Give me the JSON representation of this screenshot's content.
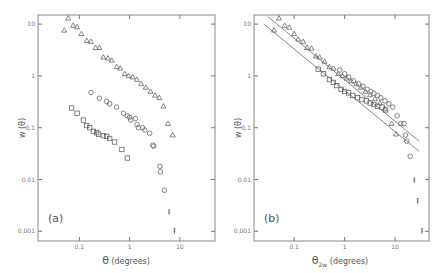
{
  "chart_data": [
    {
      "type": "scatter",
      "panel_label": "(a)",
      "title": "",
      "xlabel": "θ (degrees)",
      "ylabel": "w (θ)",
      "xscale": "log",
      "yscale": "log",
      "xlim": [
        0.015,
        50
      ],
      "ylim": [
        0.00065,
        15
      ],
      "x_ticks": [
        0.1,
        1,
        10
      ],
      "x_tick_labels": [
        "0.1",
        "1",
        "10"
      ],
      "y_ticks": [
        10,
        1,
        0.1,
        0.01,
        0.001
      ],
      "y_tick_labels": [
        "10",
        "1",
        "0.1",
        "0.01",
        "0.001"
      ],
      "grid": false,
      "legend": null,
      "series": [
        {
          "name": "triangles",
          "marker": "triangle",
          "points": [
            [
              0.05,
              7.6
            ],
            [
              0.06,
              13
            ],
            [
              0.075,
              9.4
            ],
            [
              0.09,
              8.8
            ],
            [
              0.11,
              6.5
            ],
            [
              0.14,
              4.8
            ],
            [
              0.17,
              4.6
            ],
            [
              0.21,
              3.5
            ],
            [
              0.25,
              3.5
            ],
            [
              0.3,
              2.3
            ],
            [
              0.37,
              2.2
            ],
            [
              0.44,
              2.0
            ],
            [
              0.55,
              1.5
            ],
            [
              0.65,
              1.4
            ],
            [
              0.8,
              1.1
            ],
            [
              0.95,
              1.0
            ],
            [
              1.15,
              0.95
            ],
            [
              1.4,
              0.85
            ],
            [
              1.7,
              0.7
            ],
            [
              2.1,
              0.6
            ],
            [
              2.6,
              0.5
            ],
            [
              3.2,
              0.42
            ],
            [
              3.9,
              0.38
            ],
            [
              4.7,
              0.26
            ],
            [
              5.8,
              0.12
            ],
            [
              7.2,
              0.072
            ]
          ]
        },
        {
          "name": "circles",
          "marker": "circle",
          "points": [
            [
              0.17,
              0.48
            ],
            [
              0.25,
              0.37
            ],
            [
              0.35,
              0.32
            ],
            [
              0.4,
              0.29
            ],
            [
              0.55,
              0.25
            ],
            [
              0.75,
              0.19
            ],
            [
              0.9,
              0.17
            ],
            [
              1.0,
              0.16
            ],
            [
              1.05,
              0.14
            ],
            [
              1.3,
              0.15
            ],
            [
              1.4,
              0.115
            ],
            [
              1.5,
              0.1
            ],
            [
              1.8,
              0.1
            ],
            [
              2.0,
              0.09
            ],
            [
              2.5,
              0.078
            ],
            [
              2.9,
              0.046
            ],
            [
              3.0,
              0.044
            ],
            [
              4.0,
              0.018
            ],
            [
              4.1,
              0.014
            ],
            [
              4.9,
              0.0062
            ]
          ]
        },
        {
          "name": "squares",
          "marker": "square",
          "points": [
            [
              0.07,
              0.24
            ],
            [
              0.09,
              0.19
            ],
            [
              0.12,
              0.14
            ],
            [
              0.14,
              0.11
            ],
            [
              0.16,
              0.1
            ],
            [
              0.19,
              0.085
            ],
            [
              0.22,
              0.08
            ],
            [
              0.24,
              0.075
            ],
            [
              0.3,
              0.07
            ],
            [
              0.35,
              0.068
            ],
            [
              0.4,
              0.062
            ],
            [
              0.5,
              0.053
            ],
            [
              0.7,
              0.038
            ],
            [
              0.9,
              0.026
            ]
          ]
        },
        {
          "name": "error-bar points",
          "marker": "bar",
          "points": [
            [
              6.1,
              0.0023
            ],
            [
              7.8,
              0.001
            ]
          ]
        }
      ]
    },
    {
      "type": "scatter",
      "panel_label": "(b)",
      "title": "",
      "xlabel": "θ2w (degrees)",
      "xlabel_main": "θ",
      "xlabel_sub": "2w",
      "xlabel_rest": "(degrees)",
      "ylabel": "w (θ)",
      "xscale": "log",
      "yscale": "log",
      "xlim": [
        0.016,
        47
      ],
      "ylim": [
        0.00065,
        15
      ],
      "x_ticks": [
        0.1,
        1,
        10
      ],
      "x_tick_labels": [
        "0.1",
        "1",
        "10"
      ],
      "y_ticks": [
        10,
        1,
        0.1,
        0.01,
        0.001
      ],
      "y_tick_labels": [
        "10",
        "1",
        "0.1",
        "0.01",
        "0.001"
      ],
      "grid": false,
      "legend": null,
      "fit_lines": [
        {
          "x": [
            0.03,
            30
          ],
          "y": [
            14,
            0.055
          ]
        },
        {
          "x": [
            0.025,
            30
          ],
          "y": [
            10,
            0.035
          ]
        }
      ],
      "series": [
        {
          "name": "triangles",
          "marker": "triangle",
          "points": [
            [
              0.04,
              7.6
            ],
            [
              0.05,
              13
            ],
            [
              0.065,
              9.4
            ],
            [
              0.08,
              8.6
            ],
            [
              0.1,
              6.5
            ],
            [
              0.12,
              5.1
            ],
            [
              0.15,
              4.6
            ],
            [
              0.18,
              3.5
            ],
            [
              0.22,
              3.4
            ],
            [
              0.27,
              2.4
            ],
            [
              0.32,
              2.3
            ],
            [
              0.4,
              1.9
            ],
            [
              0.5,
              1.5
            ],
            [
              0.6,
              1.4
            ],
            [
              0.75,
              1.1
            ],
            [
              0.9,
              1.0
            ],
            [
              1.1,
              0.9
            ],
            [
              1.35,
              0.8
            ],
            [
              1.7,
              0.7
            ],
            [
              2.1,
              0.6
            ],
            [
              2.6,
              0.5
            ],
            [
              3.2,
              0.43
            ],
            [
              4.0,
              0.36
            ],
            [
              5.0,
              0.3
            ],
            [
              6.3,
              0.23
            ],
            [
              8.5,
              0.12
            ],
            [
              10.5,
              0.075
            ]
          ]
        },
        {
          "name": "circles",
          "marker": "circle",
          "points": [
            [
              0.8,
              1.3
            ],
            [
              1.0,
              1.1
            ],
            [
              1.2,
              0.95
            ],
            [
              1.5,
              0.8
            ],
            [
              1.9,
              0.7
            ],
            [
              2.3,
              0.63
            ],
            [
              2.8,
              0.55
            ],
            [
              3.3,
              0.5
            ],
            [
              3.8,
              0.46
            ],
            [
              4.5,
              0.42
            ],
            [
              5.2,
              0.38
            ],
            [
              6.3,
              0.33
            ],
            [
              7.5,
              0.29
            ],
            [
              9.0,
              0.25
            ],
            [
              11,
              0.17
            ],
            [
              13,
              0.12
            ],
            [
              15,
              0.12
            ],
            [
              16,
              0.072
            ],
            [
              17,
              0.055
            ],
            [
              20,
              0.028
            ]
          ]
        },
        {
          "name": "squares",
          "marker": "square",
          "points": [
            [
              0.3,
              1.35
            ],
            [
              0.38,
              1.1
            ],
            [
              0.5,
              0.85
            ],
            [
              0.6,
              0.75
            ],
            [
              0.7,
              0.65
            ],
            [
              0.85,
              0.55
            ],
            [
              1.0,
              0.5
            ],
            [
              1.2,
              0.47
            ],
            [
              1.45,
              0.42
            ],
            [
              1.8,
              0.38
            ],
            [
              2.2,
              0.35
            ],
            [
              2.7,
              0.33
            ],
            [
              3.2,
              0.3
            ],
            [
              3.8,
              0.28
            ],
            [
              4.5,
              0.26
            ],
            [
              5.5,
              0.25
            ],
            [
              6.5,
              0.22
            ]
          ]
        },
        {
          "name": "error-bar points",
          "marker": "bar",
          "points": [
            [
              24,
              0.0095
            ],
            [
              28,
              0.0038
            ],
            [
              34,
              0.001
            ]
          ]
        }
      ]
    }
  ]
}
